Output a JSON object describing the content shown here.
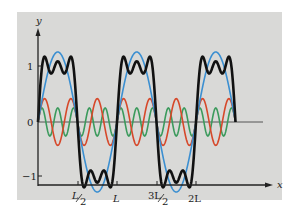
{
  "chart_data": {
    "type": "line",
    "title": "",
    "xlabel": "x",
    "ylabel": "y",
    "x_ticks": [
      "L/2",
      "L",
      "3L/2",
      "2L"
    ],
    "y_ticks": [
      "1",
      "0",
      "-1"
    ],
    "x_range_in_L": [
      0,
      2.5
    ],
    "curves_end_in_L": 2.5,
    "ylim": [
      -1.3,
      1.3
    ],
    "period_in_L": 1,
    "series": [
      {
        "name": "fundamental (4/π)·sin(2πx/L)",
        "color": "#3b8fd1",
        "amplitude": 1.273,
        "harmonic": 1
      },
      {
        "name": "third harmonic (4/3π)·sin(6πx/L)",
        "color": "#d6482a",
        "amplitude": 0.424,
        "harmonic": 3
      },
      {
        "name": "fifth harmonic (4/5π)·sin(10πx/L)",
        "color": "#3b9a5c",
        "amplitude": 0.255,
        "harmonic": 5
      },
      {
        "name": "sum of harmonics 1+3+5 (square wave approx.)",
        "color": "#111111",
        "harmonic": "sum"
      }
    ],
    "grid": false,
    "legend": "none"
  },
  "labels": {
    "y_axis": "y",
    "x_axis": "x",
    "y1": "1",
    "y0": "0",
    "yneg1": "−1",
    "tick_half_L_num": "L",
    "tick_half_L_den": "2",
    "tick_L": "L",
    "tick_3half_num": "3L",
    "tick_3half_den": "2",
    "tick_2L": "2L"
  }
}
